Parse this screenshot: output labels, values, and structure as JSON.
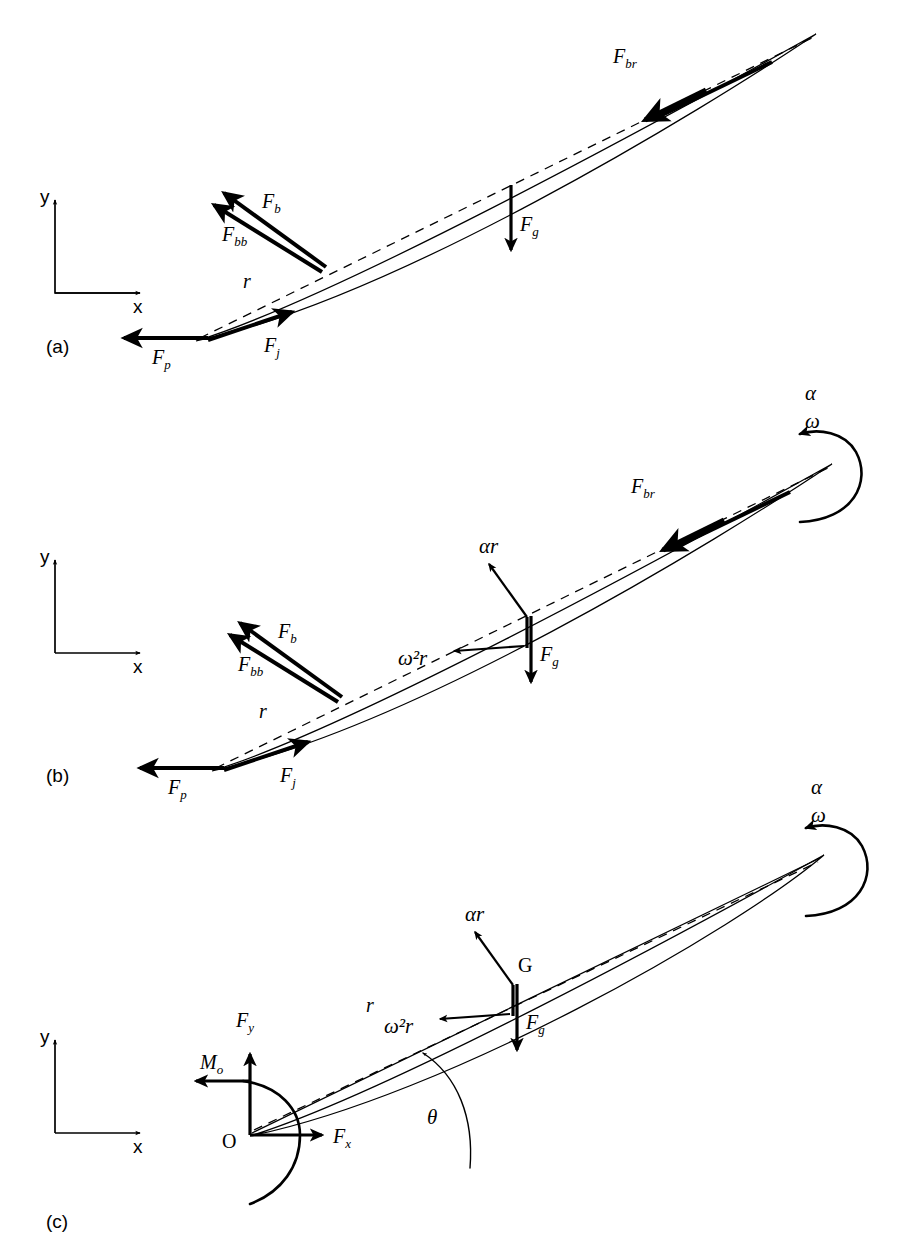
{
  "figure": {
    "type": "free-body-diagram",
    "background_color": "#ffffff",
    "ink_color": "#000000"
  },
  "axis_labels": {
    "x": "x",
    "y": "y"
  },
  "panels": [
    {
      "id": "a",
      "label": "(a)",
      "forces": [
        {
          "symbol": "F",
          "sub": "br",
          "name": "blade-reaction-force"
        },
        {
          "symbol": "F",
          "sub": "g",
          "name": "gravity-force"
        },
        {
          "symbol": "F",
          "sub": "b",
          "name": "handle-force"
        },
        {
          "symbol": "F",
          "sub": "bb",
          "name": "handle-back-force"
        },
        {
          "symbol": "F",
          "sub": "p",
          "name": "pin-force"
        },
        {
          "symbol": "F",
          "sub": "j",
          "name": "joint-force"
        }
      ],
      "dimension": {
        "symbol": "r",
        "name": "radius-to-centre-of-gravity"
      }
    },
    {
      "id": "b",
      "label": "(b)",
      "forces": [
        {
          "symbol": "F",
          "sub": "br",
          "name": "blade-reaction-force"
        },
        {
          "symbol": "F",
          "sub": "g",
          "name": "gravity-force"
        },
        {
          "symbol": "F",
          "sub": "b",
          "name": "handle-force"
        },
        {
          "symbol": "F",
          "sub": "bb",
          "name": "handle-back-force"
        },
        {
          "symbol": "F",
          "sub": "p",
          "name": "pin-force"
        },
        {
          "symbol": "F",
          "sub": "j",
          "name": "joint-force"
        }
      ],
      "accelerations": [
        {
          "symbol": "αr",
          "name": "tangential-acceleration"
        },
        {
          "symbol": "ω²r",
          "name": "centripetal-acceleration"
        }
      ],
      "rotation": {
        "alpha": "α",
        "omega": "ω"
      },
      "dimension": {
        "symbol": "r",
        "name": "radius-to-centre-of-gravity"
      }
    },
    {
      "id": "c",
      "label": "(c)",
      "reactions": [
        {
          "symbol": "F",
          "sub": "y",
          "name": "pivot-reaction-y"
        },
        {
          "symbol": "F",
          "sub": "x",
          "name": "pivot-reaction-x"
        },
        {
          "symbol": "M",
          "sub": "o",
          "name": "pivot-moment"
        },
        {
          "symbol": "F",
          "sub": "g",
          "name": "gravity-force"
        }
      ],
      "accelerations": [
        {
          "symbol": "αr",
          "name": "tangential-acceleration"
        },
        {
          "symbol": "ω²r",
          "name": "centripetal-acceleration"
        }
      ],
      "rotation": {
        "alpha": "α",
        "omega": "ω"
      },
      "points": [
        {
          "symbol": "O",
          "name": "pivot-point"
        },
        {
          "symbol": "G",
          "name": "centre-of-gravity"
        }
      ],
      "angle": {
        "symbol": "θ",
        "name": "blade-angle"
      },
      "dimension": {
        "symbol": "r",
        "name": "radius-to-centre-of-gravity"
      }
    }
  ]
}
